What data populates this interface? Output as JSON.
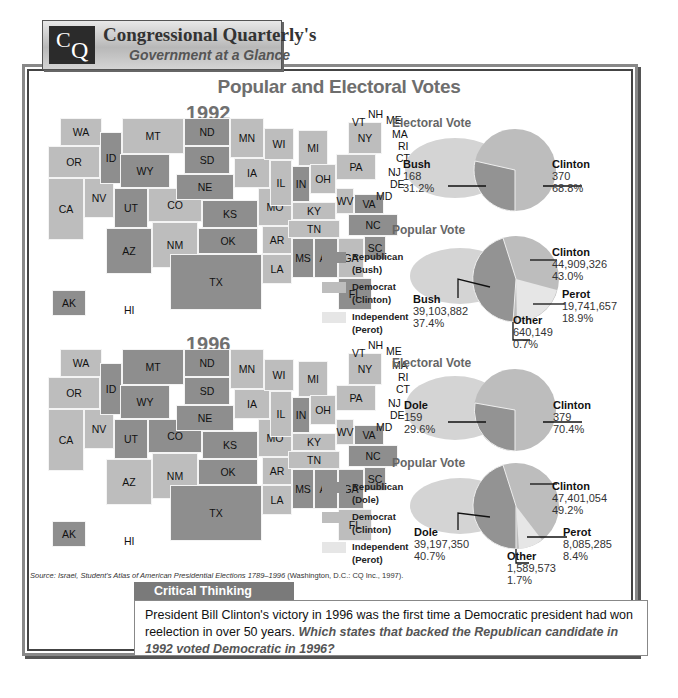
{
  "header": {
    "logo_c": "C",
    "logo_q": "Q",
    "title": "Congressional Quarterly's",
    "subtitle": "Government at a Glance"
  },
  "main_title": "Popular and Electoral Votes",
  "maps": [
    {
      "year": "1992",
      "legend": [
        {
          "label": "Republican",
          "sub": "(Bush)",
          "color": "#8e8e8e"
        },
        {
          "label": "Democrat",
          "sub": "(Clinton)",
          "color": "#bdbdbd"
        },
        {
          "label": "Independent",
          "sub": "(Perot)",
          "color": "#e6e6e6"
        }
      ],
      "states": {
        "WA": "dem",
        "OR": "dem",
        "CA": "dem",
        "NV": "dem",
        "ID": "rep",
        "MT": "dem",
        "WY": "rep",
        "UT": "rep",
        "CO": "dem",
        "AZ": "rep",
        "NM": "dem",
        "ND": "rep",
        "SD": "rep",
        "NE": "rep",
        "KS": "rep",
        "OK": "rep",
        "TX": "rep",
        "MN": "dem",
        "IA": "dem",
        "MO": "dem",
        "AR": "dem",
        "LA": "dem",
        "WI": "dem",
        "IL": "dem",
        "MS": "rep",
        "MI": "dem",
        "IN": "rep",
        "OH": "dem",
        "KY": "dem",
        "TN": "dem",
        "AL": "rep",
        "GA": "dem",
        "FL": "rep",
        "SC": "rep",
        "NC": "rep",
        "VA": "rep",
        "WV": "dem",
        "PA": "dem",
        "NY": "dem",
        "ME": "dem",
        "NH": "dem",
        "VT": "dem",
        "MA": "dem",
        "RI": "dem",
        "CT": "dem",
        "NJ": "dem",
        "DE": "dem",
        "MD": "dem",
        "AK": "rep",
        "HI": "dem"
      }
    },
    {
      "year": "1996",
      "legend": [
        {
          "label": "Republican",
          "sub": "(Dole)",
          "color": "#8e8e8e"
        },
        {
          "label": "Democrat",
          "sub": "(Clinton)",
          "color": "#bdbdbd"
        },
        {
          "label": "Independent",
          "sub": "(Perot)",
          "color": "#e6e6e6"
        }
      ],
      "states": {
        "WA": "dem",
        "OR": "dem",
        "CA": "dem",
        "NV": "dem",
        "ID": "rep",
        "MT": "rep",
        "WY": "rep",
        "UT": "rep",
        "CO": "rep",
        "AZ": "dem",
        "NM": "dem",
        "ND": "rep",
        "SD": "rep",
        "NE": "rep",
        "KS": "rep",
        "OK": "rep",
        "TX": "rep",
        "MN": "dem",
        "IA": "dem",
        "MO": "dem",
        "AR": "dem",
        "LA": "dem",
        "WI": "dem",
        "IL": "dem",
        "MS": "rep",
        "MI": "dem",
        "IN": "rep",
        "OH": "dem",
        "KY": "dem",
        "TN": "dem",
        "AL": "rep",
        "GA": "rep",
        "FL": "dem",
        "SC": "rep",
        "NC": "rep",
        "VA": "rep",
        "WV": "dem",
        "PA": "dem",
        "NY": "dem",
        "ME": "dem",
        "NH": "dem",
        "VT": "dem",
        "MA": "dem",
        "RI": "dem",
        "CT": "dem",
        "NJ": "dem",
        "DE": "dem",
        "MD": "dem",
        "AK": "rep",
        "HI": "dem"
      }
    }
  ],
  "source": {
    "prefix": "Source: Israel, ",
    "title": "Student's Atlas of American Presidential Elections 1789–1996",
    "suffix": " (Washington, D.C.: CQ Inc., 1997)."
  },
  "critical_thinking": {
    "tab": "Critical Thinking",
    "text": "President Bill Clinton's victory in 1996 was the first time a Democratic president had won reelection in over 50 years. ",
    "question": "Which states that backed the Republican candidate in 1992 voted Democratic in 1996?"
  },
  "chart_data": [
    {
      "type": "pie",
      "title": "Electoral Vote 1992",
      "categories": [
        "Bush",
        "Clinton"
      ],
      "values": [
        168,
        370
      ],
      "percent": [
        31.2,
        68.8
      ],
      "value_labels": [
        "168",
        "370"
      ],
      "percent_labels": [
        "31.2%",
        "68.8%"
      ]
    },
    {
      "type": "pie",
      "title": "Popular Vote 1992",
      "categories": [
        "Clinton",
        "Bush",
        "Perot",
        "Other"
      ],
      "values": [
        44909326,
        39103882,
        19741657,
        640149
      ],
      "percent": [
        43.0,
        37.4,
        18.9,
        0.7
      ],
      "value_labels": [
        "44,909,326",
        "39,103,882",
        "19,741,657",
        "640,149"
      ],
      "percent_labels": [
        "43.0%",
        "37.4%",
        "18.9%",
        "0.7%"
      ]
    },
    {
      "type": "pie",
      "title": "Electoral Vote 1996",
      "categories": [
        "Dole",
        "Clinton"
      ],
      "values": [
        159,
        379
      ],
      "percent": [
        29.6,
        70.4
      ],
      "value_labels": [
        "159",
        "379"
      ],
      "percent_labels": [
        "29.6%",
        "70.4%"
      ]
    },
    {
      "type": "pie",
      "title": "Popular Vote 1996",
      "categories": [
        "Clinton",
        "Dole",
        "Perot",
        "Other"
      ],
      "values": [
        47401054,
        39197350,
        8085285,
        1589573
      ],
      "percent": [
        49.2,
        40.7,
        8.4,
        1.7
      ],
      "value_labels": [
        "47,401,054",
        "39,197,350",
        "8,085,285",
        "1,589,573"
      ],
      "percent_labels": [
        "49.2%",
        "40.7%",
        "8.4%",
        "1.7%"
      ]
    }
  ],
  "pies": {
    "ev92": {
      "title": "Electoral Vote",
      "a": {
        "name": "Bush",
        "v": "168",
        "p": "31.2%"
      },
      "b": {
        "name": "Clinton",
        "v": "370",
        "p": "68.8%"
      }
    },
    "pv92": {
      "title": "Popular Vote",
      "clinton": {
        "name": "Clinton",
        "v": "44,909,326",
        "p": "43.0%"
      },
      "rep": {
        "name": "Bush",
        "v": "39,103,882",
        "p": "37.4%"
      },
      "perot": {
        "name": "Perot",
        "v": "19,741,657",
        "p": "18.9%"
      },
      "other": {
        "name": "Other",
        "v": "640,149",
        "p": "0.7%"
      }
    },
    "ev96": {
      "title": "Electoral Vote",
      "a": {
        "name": "Dole",
        "v": "159",
        "p": "29.6%"
      },
      "b": {
        "name": "Clinton",
        "v": "379",
        "p": "70.4%"
      }
    },
    "pv96": {
      "title": "Popular Vote",
      "clinton": {
        "name": "Clinton",
        "v": "47,401,054",
        "p": "49.2%"
      },
      "rep": {
        "name": "Dole",
        "v": "39,197,350",
        "p": "40.7%"
      },
      "perot": {
        "name": "Perot",
        "v": "8,085,285",
        "p": "8.4%"
      },
      "other": {
        "name": "Other",
        "v": "1,589,573",
        "p": "1.7%"
      }
    }
  }
}
